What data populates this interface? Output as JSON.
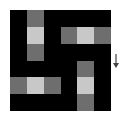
{
  "colors": {
    "empty": "#000000",
    "car": "#6e6e6e",
    "head": "#c8c8c8",
    "arrow": "#444444"
  },
  "grid": {
    "rows": 6,
    "cols": 6,
    "cells": [
      [
        "empty",
        "car",
        "empty",
        "empty",
        "empty",
        "empty"
      ],
      [
        "empty",
        "head",
        "empty",
        "car",
        "head",
        "car"
      ],
      [
        "empty",
        "car",
        "empty",
        "empty",
        "empty",
        "empty"
      ],
      [
        "empty",
        "empty",
        "empty",
        "empty",
        "car",
        "empty"
      ],
      [
        "car",
        "head",
        "car",
        "empty",
        "head",
        "empty"
      ],
      [
        "empty",
        "empty",
        "empty",
        "empty",
        "car",
        "empty"
      ]
    ]
  },
  "indicator": {
    "icon": "arrow-down-icon",
    "glyph": "↓"
  }
}
